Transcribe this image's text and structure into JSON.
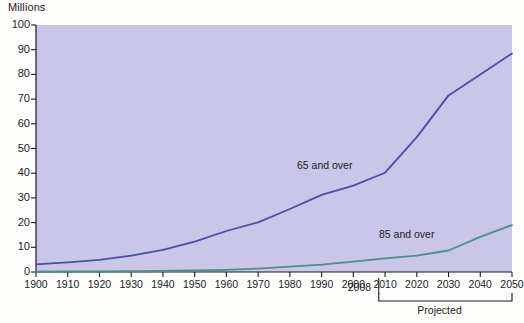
{
  "chart_data": {
    "type": "line",
    "title": "",
    "ylabel": "Millions",
    "xlabel": "",
    "ylim": [
      0,
      100
    ],
    "xlim": [
      1900,
      2050
    ],
    "ytick_step": 10,
    "grid": false,
    "legend_position": "inline-annotation",
    "yticks": [
      "0",
      "10",
      "20",
      "30",
      "40",
      "50",
      "60",
      "70",
      "80",
      "90",
      "100"
    ],
    "xticks": [
      "1900",
      "1910",
      "1920",
      "1930",
      "1940",
      "1950",
      "1960",
      "1970",
      "1980",
      "1990",
      "2000",
      "2010",
      "2020",
      "2030",
      "2040",
      "2050"
    ],
    "x": [
      1900,
      1910,
      1920,
      1930,
      1940,
      1950,
      1960,
      1970,
      1980,
      1990,
      2000,
      2010,
      2020,
      2030,
      2040,
      2050
    ],
    "series": [
      {
        "name": "65 and over",
        "color": "#4a4f9e",
        "values": [
          3.1,
          3.9,
          4.9,
          6.6,
          9.0,
          12.3,
          16.6,
          20.1,
          25.5,
          31.2,
          35.0,
          40.2,
          54.6,
          71.5,
          80.0,
          88.5
        ]
      },
      {
        "name": "85 and over",
        "color": "#4a8f8c",
        "values": [
          0.1,
          0.2,
          0.2,
          0.3,
          0.4,
          0.6,
          0.9,
          1.4,
          2.2,
          3.0,
          4.2,
          5.5,
          6.6,
          8.7,
          14.2,
          19.0
        ]
      }
    ],
    "annotations": [
      {
        "id": "marker-2008",
        "label": "2008",
        "x": 2008
      },
      {
        "id": "projected-bracket",
        "label": "Projected",
        "x_start": 2008,
        "x_end": 2050
      }
    ],
    "colors": {
      "plot_background": "#c9c6e9",
      "figure_background": "#fdfdfc",
      "axis": "#1c1c1c",
      "series_65": "#4a4f9e",
      "series_85": "#4a8f8c"
    }
  }
}
